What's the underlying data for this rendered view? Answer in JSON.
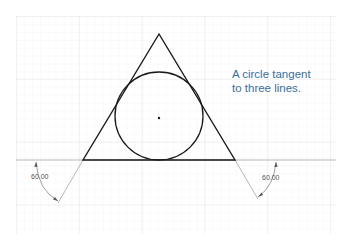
{
  "annotation": {
    "line1": "A circle tangent",
    "line2": "to three lines."
  },
  "dimensions": {
    "left_angle": "60.00",
    "right_angle": "60.00"
  },
  "colors": {
    "grid_minor": "#f0f0f0",
    "grid_major": "#e2e2e2",
    "geometry": "#1a1a1a",
    "construction": "#9a9a9a",
    "annotation_text": "#3a6f9a",
    "dimension_text": "#555555"
  },
  "geometry": {
    "triangle": {
      "apex": [
        159,
        34
      ],
      "base_left": [
        83,
        160
      ],
      "base_right": [
        235,
        160
      ]
    },
    "circle": {
      "center": [
        159,
        118
      ],
      "radius": 44
    },
    "baseline": {
      "x1": 16,
      "x2": 336,
      "y": 160
    }
  }
}
